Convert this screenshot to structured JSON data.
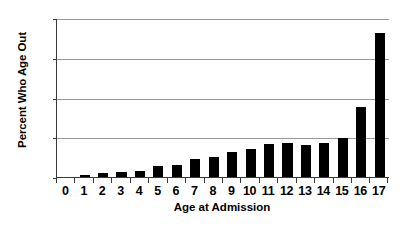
{
  "chart_data": {
    "type": "bar",
    "title": "",
    "xlabel": "Age at Admission",
    "ylabel": "Percent Who Age Out",
    "categories": [
      "0",
      "1",
      "2",
      "3",
      "4",
      "5",
      "6",
      "7",
      "8",
      "9",
      "10",
      "11",
      "12",
      "13",
      "14",
      "15",
      "16",
      "17"
    ],
    "values": [
      0,
      0.8,
      1.6,
      1.8,
      2.2,
      4.1,
      4.4,
      6.8,
      7.4,
      9.3,
      10.7,
      12.5,
      12.8,
      11.9,
      12.9,
      14.9,
      26.5,
      54.5
    ],
    "ylim": [
      0,
      60
    ],
    "yticks": [
      0,
      15,
      30,
      45,
      60
    ],
    "ytick_labels": [
      "0",
      "15",
      "30",
      "45",
      "60"
    ],
    "grid": true,
    "legend": false,
    "bar_color": "#000000",
    "gridline_color": "#9a9a9a",
    "axis_color": "#3a3a3a",
    "background": "#ffffff"
  }
}
